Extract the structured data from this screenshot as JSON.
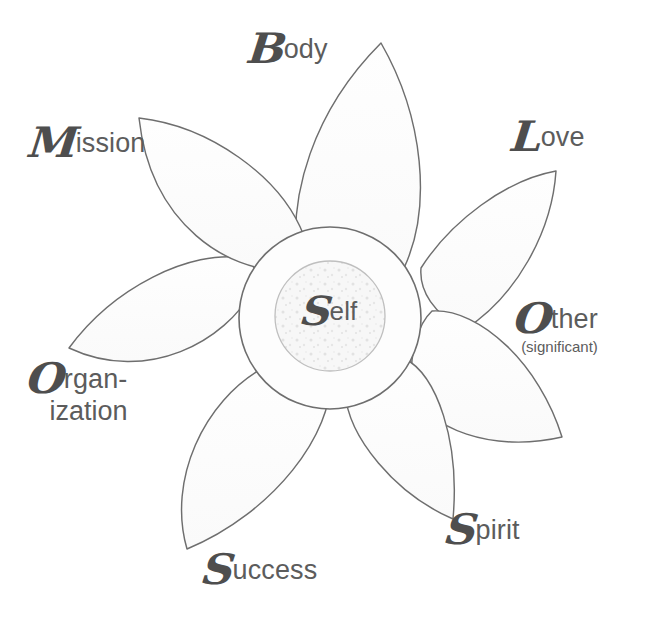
{
  "diagram": {
    "type": "radial petal diagram",
    "background_color": "#ffffff",
    "line_color": "#6e6e6e",
    "petal_fill": "#fdfdfd",
    "text_color": "#5a5a5a",
    "center": {
      "label_initial": "S",
      "label_rest": "elf",
      "full_label": "Self",
      "outer_circle_fill": "#fdfdfd",
      "inner_circle_fill": "#f6f6f6"
    },
    "petals": [
      {
        "id": "body",
        "label_initial": "B",
        "label_rest": "ody",
        "full_label": "Body",
        "angle_deg": -90,
        "position": "top"
      },
      {
        "id": "love",
        "label_initial": "L",
        "label_rest": "ove",
        "full_label": "Love",
        "angle_deg": -40,
        "position": "upper-right"
      },
      {
        "id": "other",
        "label_initial": "O",
        "label_rest": "ther",
        "sub_label": "(significant)",
        "full_label": "Other (significant)",
        "angle_deg": 7,
        "position": "right"
      },
      {
        "id": "spirit",
        "label_initial": "S",
        "label_rest": "pirit",
        "full_label": "Spirit",
        "angle_deg": 52,
        "position": "lower-right"
      },
      {
        "id": "success",
        "label_initial": "S",
        "label_rest": "uccess",
        "full_label": "Success",
        "angle_deg": 105,
        "position": "bottom"
      },
      {
        "id": "organization",
        "label_initial": "O",
        "label_rest": "rgan-",
        "label_line2": "ization",
        "full_label": "Organization",
        "angle_deg": 172,
        "position": "left"
      },
      {
        "id": "mission",
        "label_initial": "M",
        "label_rest": "ission",
        "full_label": "Mission",
        "angle_deg": -137,
        "position": "upper-left"
      }
    ]
  }
}
